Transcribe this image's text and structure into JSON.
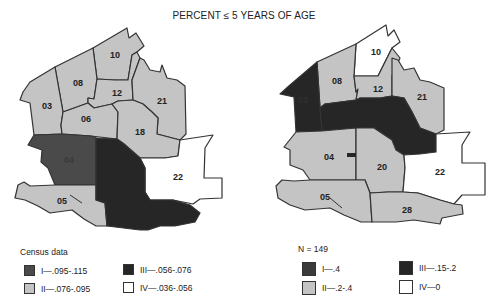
{
  "title": "PERCENT ≤ 5 YEARS OF AGE",
  "colors": {
    "class_I": "#4a4a4a",
    "class_II": "#c4c4c4",
    "class_III": "#262626",
    "class_IV": "#ffffff",
    "outline": "#333333"
  },
  "left_map": {
    "regions": [
      {
        "id": "10",
        "class": "II"
      },
      {
        "id": "08",
        "class": "II"
      },
      {
        "id": "03",
        "class": "II"
      },
      {
        "id": "12",
        "class": "II"
      },
      {
        "id": "21",
        "class": "II"
      },
      {
        "id": "06",
        "class": "II"
      },
      {
        "id": "18",
        "class": "II"
      },
      {
        "id": "04",
        "class": "I"
      },
      {
        "id": "22",
        "class": "IV"
      },
      {
        "id": "05",
        "class": "II"
      },
      {
        "id": "20",
        "class": "III"
      }
    ],
    "legend": {
      "heading": "Census data",
      "items": [
        {
          "label": "I—.095-.115",
          "class": "I"
        },
        {
          "label": "II—.076-.095",
          "class": "II"
        },
        {
          "label": "III—.056-.076",
          "class": "III"
        },
        {
          "label": "IV—.036-.056",
          "class": "IV"
        }
      ]
    }
  },
  "right_map": {
    "regions": [
      {
        "id": "10",
        "class": "IV"
      },
      {
        "id": "08",
        "class": "II"
      },
      {
        "id": "03",
        "class": "III"
      },
      {
        "id": "12",
        "class": "II"
      },
      {
        "id": "21",
        "class": "II"
      },
      {
        "id": "06",
        "class": "III"
      },
      {
        "id": "04",
        "class": "II"
      },
      {
        "id": "20",
        "class": "II"
      },
      {
        "id": "22",
        "class": "IV"
      },
      {
        "id": "05",
        "class": "II"
      },
      {
        "id": "28",
        "class": "II"
      }
    ],
    "legend": {
      "heading": "N = 149",
      "items": [
        {
          "label": "I—.4",
          "class": "I"
        },
        {
          "label": "II—.2-.4",
          "class": "II"
        },
        {
          "label": "III—.15-.2",
          "class": "III"
        },
        {
          "label": "IV—0",
          "class": "IV"
        }
      ]
    }
  }
}
